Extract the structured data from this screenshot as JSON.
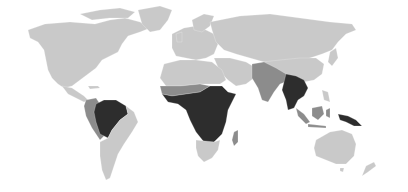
{
  "map": {
    "type": "choropleth world map",
    "background_color": "#ffffff",
    "legend": [],
    "levels": {
      "light": "#c9c9c9",
      "medium": "#8c8c8c",
      "dark": "#2d2d2d"
    },
    "regions": [
      {
        "name": "North America",
        "level": "light"
      },
      {
        "name": "Greenland",
        "level": "light"
      },
      {
        "name": "Central America",
        "level": "light"
      },
      {
        "name": "Colombia / Peru / Ecuador",
        "level": "medium"
      },
      {
        "name": "Amazon basin (Brazil north, Venezuela, Guianas, Bolivia)",
        "level": "dark"
      },
      {
        "name": "Southern South America",
        "level": "light"
      },
      {
        "name": "Europe",
        "level": "light"
      },
      {
        "name": "Russia / Central Asia",
        "level": "light"
      },
      {
        "name": "North Africa",
        "level": "light"
      },
      {
        "name": "Middle East",
        "level": "light"
      },
      {
        "name": "Sahel belt",
        "level": "medium"
      },
      {
        "name": "Sub-Saharan tropical Africa",
        "level": "dark"
      },
      {
        "name": "Southern Africa",
        "level": "light"
      },
      {
        "name": "Madagascar",
        "level": "medium"
      },
      {
        "name": "South Asia (India, Pakistan, Nepal)",
        "level": "medium"
      },
      {
        "name": "China / Mongolia",
        "level": "light"
      },
      {
        "name": "Mainland Southeast Asia (Myanmar, Thailand, Laos, Cambodia, Vietnam)",
        "level": "dark"
      },
      {
        "name": "Maritime Southeast Asia (Indonesia, Malaysia, Philippines)",
        "level": "medium"
      },
      {
        "name": "New Guinea",
        "level": "dark"
      },
      {
        "name": "Australia",
        "level": "light"
      },
      {
        "name": "New Zealand",
        "level": "light"
      },
      {
        "name": "Japan",
        "level": "light"
      }
    ]
  }
}
